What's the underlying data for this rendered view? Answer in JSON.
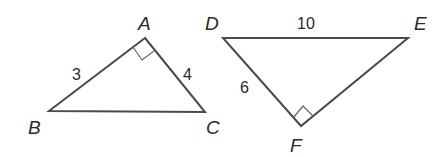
{
  "figure": {
    "colors": {
      "stroke": "#4a4a4a",
      "text": "#2a2a2a",
      "background": "#ffffff"
    }
  },
  "triangles": [
    {
      "name": "ABC",
      "vertices": {
        "A": {
          "label": "A",
          "x": 145,
          "y": 38
        },
        "B": {
          "label": "B",
          "x": 49,
          "y": 111
        },
        "C": {
          "label": "C",
          "x": 205,
          "y": 112
        }
      },
      "right_angle_at": "A",
      "sides": [
        {
          "between": "AB",
          "label": "3"
        },
        {
          "between": "AC",
          "label": "4"
        }
      ]
    },
    {
      "name": "DEF",
      "vertices": {
        "D": {
          "label": "D",
          "x": 223,
          "y": 38
        },
        "E": {
          "label": "E",
          "x": 408,
          "y": 38
        },
        "F": {
          "label": "F",
          "x": 301,
          "y": 126
        }
      },
      "right_angle_at": "F",
      "sides": [
        {
          "between": "DE",
          "label": "10"
        },
        {
          "between": "DF",
          "label": "6"
        }
      ]
    }
  ]
}
